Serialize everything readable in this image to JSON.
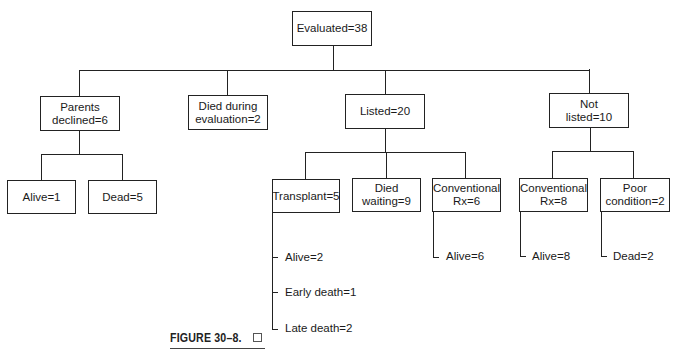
{
  "diagram": {
    "root": {
      "label": "Evaluated=38"
    },
    "level1": [
      {
        "label": "Parents\ndeclined=6"
      },
      {
        "label": "Died during\nevaluation=2"
      },
      {
        "label": "Listed=20"
      },
      {
        "label": "Not\nlisted=10"
      }
    ],
    "parents_children": [
      {
        "label": "Alive=1"
      },
      {
        "label": "Dead=5"
      }
    ],
    "listed_children": [
      {
        "label": "Transplant=5"
      },
      {
        "label": "Died\nwaiting=9"
      },
      {
        "label": "Conventional\nRx=6"
      }
    ],
    "not_listed_children": [
      {
        "label": "Conventional\nRx=8"
      },
      {
        "label": "Poor\ncondition=2"
      }
    ],
    "transplant_outcomes": [
      {
        "label": "Alive=2"
      },
      {
        "label": "Early death=1"
      },
      {
        "label": "Late death=2"
      }
    ],
    "conventional_listed_outcome": {
      "label": "Alive=6"
    },
    "conventional_not_listed_outcome": {
      "label": "Alive=8"
    },
    "poor_condition_outcome": {
      "label": "Dead=2"
    }
  },
  "caption": {
    "label": "FIGURE 30–8."
  }
}
